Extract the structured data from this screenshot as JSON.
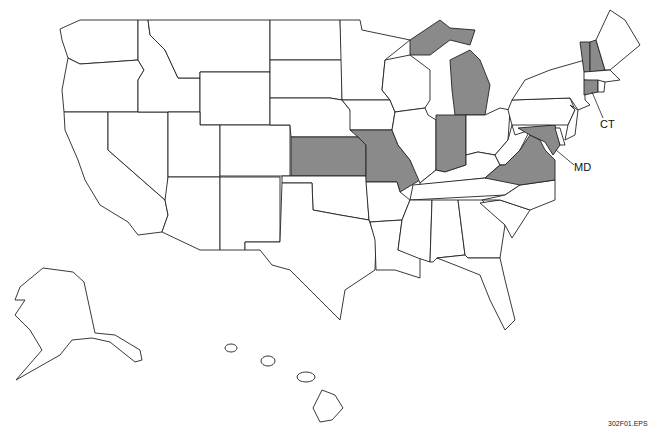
{
  "map": {
    "title": "United States map with highlighted states",
    "highlight_color": "#8a8a8a",
    "highlighted_states": [
      "KS",
      "MO",
      "MI",
      "IN",
      "VA",
      "MD",
      "VT",
      "NH",
      "CT"
    ],
    "labels": [
      {
        "text": "CT",
        "x": 600,
        "y": 124
      },
      {
        "text": "MD",
        "x": 574,
        "y": 168
      }
    ],
    "figure_id": "302F01.EPS"
  }
}
